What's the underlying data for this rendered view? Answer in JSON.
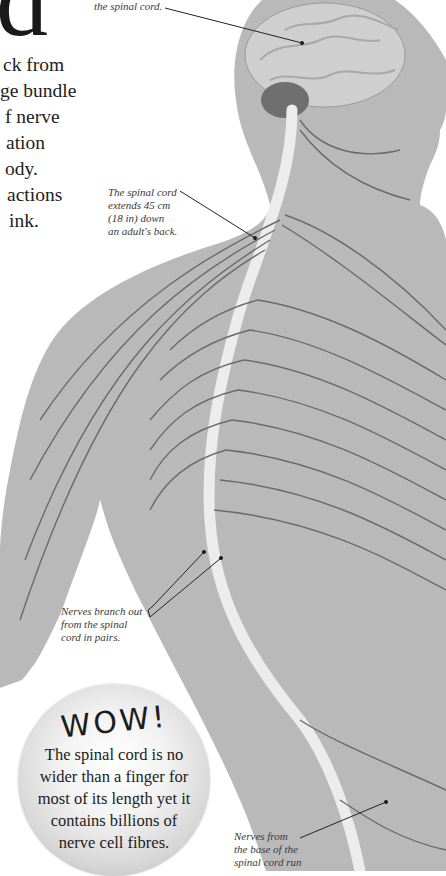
{
  "heading": {
    "drop_letter": "d"
  },
  "intro": {
    "lines": [
      "ck from",
      "ge bundle",
      "f nerve",
      "ation",
      "ody.",
      "actions",
      "ink."
    ]
  },
  "captions": {
    "brain": {
      "lines": [
        "the spinal cord."
      ]
    },
    "spinal_length": {
      "lines": [
        "The spinal cord",
        "extends 45 cm",
        "(18 in) down",
        "an adult's back."
      ]
    },
    "nerve_pairs": {
      "lines": [
        "Nerves branch out",
        "from the spinal",
        "cord in pairs."
      ]
    },
    "base_nerves": {
      "lines": [
        "Nerves from",
        "the base of the",
        "spinal cord run"
      ]
    }
  },
  "wow_box": {
    "title": "WOW!",
    "lines": [
      "The spinal cord is no",
      "wider than a finger for",
      "most of its length yet it",
      "contains billions of",
      "nerve cell fibres."
    ]
  },
  "colors": {
    "body_silhouette": "#b9b9b9",
    "spinal_cord": "#efefef",
    "nerves": "#6a6a6a",
    "brain": "#cfcfcf",
    "text": "#222222"
  }
}
